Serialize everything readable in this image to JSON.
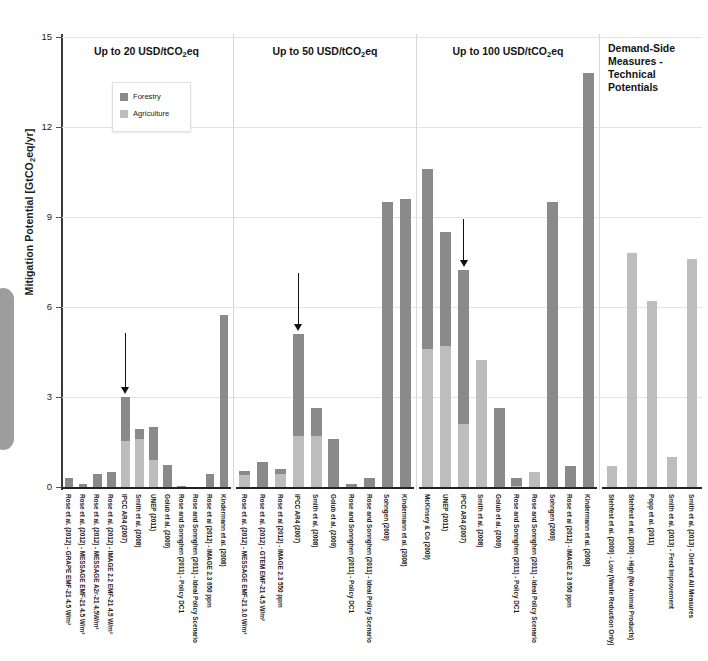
{
  "figure": {
    "y_axis_title_main": "Mitigation Potential [GtCO",
    "y_axis_title_sub": "2",
    "y_axis_title_tail": "eq/yr]",
    "colors": {
      "forestry": "#8a8a8a",
      "agriculture": "#bdbdbd",
      "grid": "#e3e3e3",
      "axis": "#3a3a3a"
    }
  },
  "legend": {
    "items": [
      {
        "label": "Forestry",
        "color": "#8a8a8a"
      },
      {
        "label": "Agriculture",
        "color": "#bdbdbd"
      }
    ]
  },
  "chart_data": {
    "type": "bar",
    "title": "",
    "xlabel": "",
    "ylabel": "Mitigation Potential [GtCO2eq/yr]",
    "ylim": [
      0,
      15
    ],
    "yticks": [
      0,
      3,
      6,
      9,
      12,
      15
    ],
    "ytick_labels": [
      "0",
      "3",
      "6",
      "9",
      "12",
      "15"
    ],
    "grid": true,
    "stacked": true,
    "legend_position": "upper-left-inside",
    "series_names": [
      "Forestry",
      "Agriculture"
    ],
    "panels": [
      {
        "title_main": "Up to 20 USD/tCO",
        "title_sub": "2",
        "title_tail": "eq",
        "annotation_arrow_at_category": "IPCC AR4 (2007)",
        "categories": [
          "Rose et al. (2012) - GRAPE EMF-21 4.5 W/m²",
          "Rose et al. (2012) - MESSAGE EMF-21 4.5 W/m²",
          "Rose et al. (2012) - MESSAGE A2r-21 4.5W/m²",
          "Rose et al. (2012) - IMAGE 2.2 EMF-21 4.5 W/m²",
          "IPCC AR4 (2007)",
          "Smith et al. (2008)",
          "UNEP (2011)",
          "Golub et al. (2009)",
          "Rose and Sonnghen (2011) - Policy DC1",
          "Rose and Sonnghen (2011) - Ideal Policy Scenario",
          "Rose et al (2012) - IMAGE 2.3 650 ppm",
          "Kindermann et al. (2008)"
        ],
        "forestry": [
          0.3,
          0.1,
          0.45,
          0.5,
          1.45,
          0.35,
          1.1,
          0.75,
          0.04,
          0.0,
          0.45,
          5.75
        ],
        "agriculture": [
          0.0,
          0.0,
          0.0,
          0.0,
          1.55,
          1.6,
          0.9,
          0.0,
          0.0,
          0.0,
          0.0,
          0.0
        ]
      },
      {
        "title_main": "Up to 50 USD/tCO",
        "title_sub": "2",
        "title_tail": "eq",
        "annotation_arrow_at_category": "IPCC AR4 (2007)",
        "categories": [
          "Rose et al. (2012) - MESSAGE EMF-21 3.0 W/m²",
          "Rose et al. (2012) - GTEM EMF-21 4.5 W/m²",
          "Rose et al (2012) - IMAGE 2.3 550 ppm",
          "IPCC AR4 (2007)",
          "Smith et al. (2008)",
          "Golub et al. (2009)",
          "Rose and Sonnghen (2011) - Policy DC1",
          "Rose and Sonnghen (2011) - Ideal Policy Scenario",
          "Sohngen (2009)",
          "Kindermann et al. (2008)"
        ],
        "forestry": [
          0.15,
          0.85,
          0.15,
          3.4,
          0.95,
          1.6,
          0.1,
          0.3,
          9.5,
          9.6
        ],
        "agriculture": [
          0.4,
          0.0,
          0.45,
          1.7,
          1.7,
          0.0,
          0.0,
          0.0,
          0.0,
          0.0
        ]
      },
      {
        "title_main": "Up to 100 USD/tCO",
        "title_sub": "2",
        "title_tail": "eq",
        "annotation_arrow_at_category": "IPCC AR4 (2007)",
        "categories": [
          "McKinsey & Co (2009)",
          "UNEP (2011)",
          "IPCC AR4 (2007)",
          "Smith et al. (2008)",
          "Golub et al. (2009)",
          "Rose and Sonnghen (2011) - Policy DC1",
          "Rose and Sonnghen (2011) - Ideal Policy Scenario",
          "Sohngen (2009)",
          "Rose et al (2012) - IMAGE 2.3 650 ppm",
          "Kindermann et al. (2008)"
        ],
        "forestry": [
          6.0,
          3.8,
          5.15,
          0.0,
          2.65,
          0.25,
          0.0,
          9.5,
          0.7,
          13.8
        ],
        "agriculture": [
          4.6,
          4.7,
          2.1,
          4.25,
          0.0,
          0.05,
          0.5,
          0.0,
          0.0,
          0.0
        ]
      },
      {
        "title_main": "Demand-Side Measures - Technical Potentials",
        "title_sub": "",
        "title_tail": "",
        "annotation_arrow_at_category": null,
        "categories": [
          "Stehfest et al. (2009) - Low (Waste Reduction Only)",
          "Stehfest et al. (2009) - High (No Animal Products)",
          "Popp et al. (2011)",
          "Smith et al. (2013) - Feed Improvement",
          "Smith et al. (2013) - Diet and All Measures"
        ],
        "forestry": [
          0.0,
          0.0,
          0.0,
          0.0,
          0.0
        ],
        "agriculture": [
          0.7,
          7.8,
          6.2,
          1.0,
          7.6
        ]
      }
    ]
  }
}
